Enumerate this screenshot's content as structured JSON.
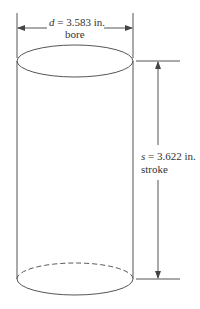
{
  "diagram": {
    "bore": {
      "symbol": "d",
      "equals": " = 3.583 in.",
      "caption": "bore"
    },
    "stroke": {
      "symbol": "s",
      "equals": " = 3.622 in.",
      "caption": "stroke"
    }
  }
}
